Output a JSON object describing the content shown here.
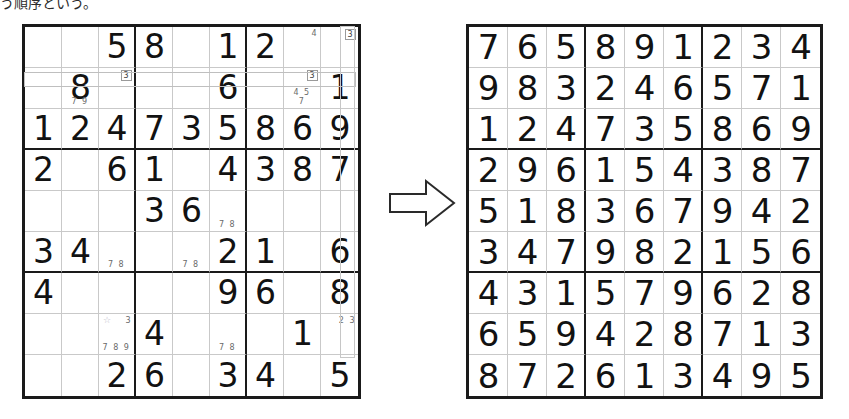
{
  "caption": {
    "text": "う順序という。"
  },
  "arrow": {
    "icon": "right-arrow-icon",
    "label": "becomes"
  },
  "puzzle": {
    "title": "Sudoku puzzle with pencil marks",
    "rows": [
      [
        {
          "value": ""
        },
        {
          "value": ""
        },
        {
          "value": "5"
        },
        {
          "value": "8"
        },
        {
          "value": ""
        },
        {
          "value": "1"
        },
        {
          "value": "2"
        },
        {
          "value": "",
          "notes_top": "4"
        },
        {
          "value": "",
          "notes_top": "3",
          "notes_top_boxed": true
        }
      ],
      [
        {
          "value": ""
        },
        {
          "value": "8",
          "notes": "7  9"
        },
        {
          "value": "",
          "notes_top": "3",
          "notes_top_boxed": true
        },
        {
          "value": ""
        },
        {
          "value": ""
        },
        {
          "value": "6"
        },
        {
          "value": ""
        },
        {
          "value": "",
          "notes": "4 5\n7",
          "notes_top": "3",
          "notes_top_boxed": true
        },
        {
          "value": "1"
        }
      ],
      [
        {
          "value": "1"
        },
        {
          "value": "2"
        },
        {
          "value": "4"
        },
        {
          "value": "7"
        },
        {
          "value": "3"
        },
        {
          "value": "5"
        },
        {
          "value": "8"
        },
        {
          "value": "6"
        },
        {
          "value": "9"
        }
      ],
      [
        {
          "value": "2"
        },
        {
          "value": ""
        },
        {
          "value": "6"
        },
        {
          "value": "1"
        },
        {
          "value": ""
        },
        {
          "value": "4"
        },
        {
          "value": "3"
        },
        {
          "value": "8"
        },
        {
          "value": "7"
        }
      ],
      [
        {
          "value": ""
        },
        {
          "value": ""
        },
        {
          "value": ""
        },
        {
          "value": "3"
        },
        {
          "value": "6"
        },
        {
          "value": "",
          "notes": "7 8"
        },
        {
          "value": ""
        },
        {
          "value": ""
        },
        {
          "value": ""
        }
      ],
      [
        {
          "value": "3"
        },
        {
          "value": "4"
        },
        {
          "value": "",
          "notes": "7 8"
        },
        {
          "value": ""
        },
        {
          "value": "",
          "notes": "7 8"
        },
        {
          "value": "2"
        },
        {
          "value": "1"
        },
        {
          "value": ""
        },
        {
          "value": "6"
        }
      ],
      [
        {
          "value": "4"
        },
        {
          "value": ""
        },
        {
          "value": ""
        },
        {
          "value": ""
        },
        {
          "value": ""
        },
        {
          "value": "9"
        },
        {
          "value": "6"
        },
        {
          "value": ""
        },
        {
          "value": "8"
        }
      ],
      [
        {
          "value": ""
        },
        {
          "value": ""
        },
        {
          "value": "",
          "notes_star": true,
          "notes_top": "3",
          "notes": "7 8 9"
        },
        {
          "value": "4"
        },
        {
          "value": ""
        },
        {
          "value": "",
          "notes": "7 8"
        },
        {
          "value": ""
        },
        {
          "value": "1"
        },
        {
          "value": "",
          "notes_top": "2 3"
        }
      ],
      [
        {
          "value": ""
        },
        {
          "value": ""
        },
        {
          "value": "2"
        },
        {
          "value": "6"
        },
        {
          "value": ""
        },
        {
          "value": "3"
        },
        {
          "value": "4"
        },
        {
          "value": ""
        },
        {
          "value": "5"
        }
      ]
    ]
  },
  "solution": {
    "title": "Completed sudoku solution",
    "rows": [
      [
        "7",
        "6",
        "5",
        "8",
        "9",
        "1",
        "2",
        "3",
        "4"
      ],
      [
        "9",
        "8",
        "3",
        "2",
        "4",
        "6",
        "5",
        "7",
        "1"
      ],
      [
        "1",
        "2",
        "4",
        "7",
        "3",
        "5",
        "8",
        "6",
        "9"
      ],
      [
        "2",
        "9",
        "6",
        "1",
        "5",
        "4",
        "3",
        "8",
        "7"
      ],
      [
        "5",
        "1",
        "8",
        "3",
        "6",
        "7",
        "9",
        "4",
        "2"
      ],
      [
        "3",
        "4",
        "7",
        "9",
        "8",
        "2",
        "1",
        "5",
        "6"
      ],
      [
        "4",
        "3",
        "1",
        "5",
        "7",
        "9",
        "6",
        "2",
        "8"
      ],
      [
        "6",
        "5",
        "9",
        "4",
        "2",
        "8",
        "7",
        "1",
        "3"
      ],
      [
        "8",
        "7",
        "2",
        "6",
        "1",
        "3",
        "4",
        "9",
        "5"
      ]
    ]
  },
  "colors": {
    "grid_line": "#1a1a1a",
    "cell_line": "#c9c9c9",
    "digit": "#121212",
    "pencil_mark": "#6a6a6a",
    "star": "#b9b9c9"
  }
}
